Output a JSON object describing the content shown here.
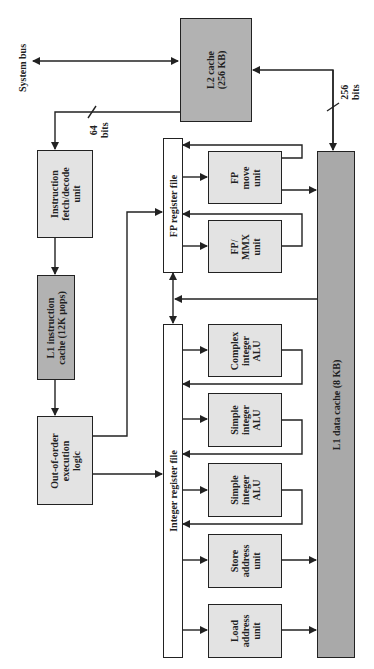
{
  "diagram": {
    "labels": {
      "system_bus": "System bus",
      "l2_cache": "L2 cache\n(256 KB)",
      "bits_64": "64\nbits",
      "bits_256": "256\nbits",
      "fetch_decode": "Instruction\nfetch/decode\nunit",
      "l1_instruction_cache": "L1 instruction\ncache (12K µops)",
      "out_of_order": "Out-of-order\nexecution\nlogic",
      "fp_register_file": "FP register file",
      "integer_register_file": "Integer register file",
      "fp_move_unit": "FP\nmove\nunit",
      "fp_mmx_unit": "FP/\nMMX\nunit",
      "complex_alu": "Complex\ninteger\nALU",
      "simple_alu_1": "Simple\ninteger\nALU",
      "simple_alu_2": "Simple\ninteger\nALU",
      "store_address_unit": "Store\naddress\nunit",
      "load_address_unit": "Load\naddress\nunit",
      "l1_data_cache": "L1 data cache (8 KB)"
    },
    "colors": {
      "cache_fill": "#b2b2b2",
      "data_cache_fill": "#a9a9a9",
      "unit_fill": "#e3e3e3",
      "line": "#222222"
    }
  }
}
